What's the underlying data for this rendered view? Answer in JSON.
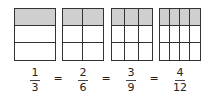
{
  "diagram": {
    "shade_color": "#cfcfcf",
    "line_color": "#333333",
    "boxes": [
      {
        "rows": 3,
        "cols": 1,
        "shaded_rows": 1,
        "left": 14
      },
      {
        "rows": 3,
        "cols": 2,
        "shaded_rows": 1,
        "left": 62
      },
      {
        "rows": 3,
        "cols": 3,
        "shaded_rows": 1,
        "left": 111
      },
      {
        "rows": 3,
        "cols": 4,
        "shaded_rows": 1,
        "left": 159
      }
    ],
    "fractions": [
      {
        "numerator": "1",
        "denominator": "3"
      },
      {
        "numerator": "2",
        "denominator": "6"
      },
      {
        "numerator": "3",
        "denominator": "9"
      },
      {
        "numerator": "4",
        "denominator": "12"
      }
    ],
    "equals": [
      "=",
      "=",
      "="
    ]
  }
}
